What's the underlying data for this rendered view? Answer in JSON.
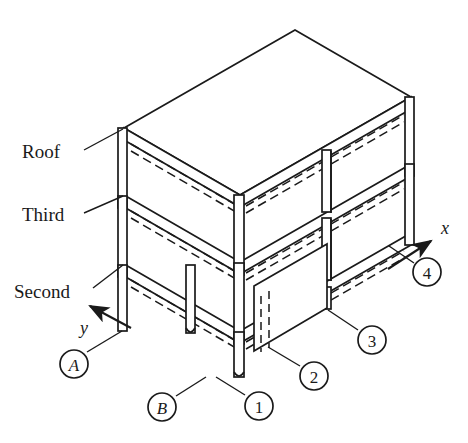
{
  "figure": {
    "kind": "isometric-structural-frame-diagram",
    "stroke_color": "#1a1a1a",
    "fill_color": "#ffffff",
    "background_color": "#ffffff"
  },
  "level_labels": [
    {
      "id": "roof",
      "text": "Roof",
      "x": 22,
      "y": 158,
      "leader_from": [
        83,
        150
      ],
      "leader_to": [
        124,
        129
      ]
    },
    {
      "id": "third",
      "text": "Third",
      "x": 22,
      "y": 221,
      "leader_from": [
        83,
        213
      ],
      "leader_to": [
        124,
        196
      ]
    },
    {
      "id": "second",
      "text": "Second",
      "x": 14,
      "y": 298,
      "leader_from": [
        92,
        290
      ],
      "leader_to": [
        124,
        265
      ]
    }
  ],
  "axes": [
    {
      "id": "x-axis",
      "label": "x",
      "label_x": 442,
      "label_y": 233,
      "tail": [
        388,
        268
      ],
      "head": [
        432,
        240
      ]
    },
    {
      "id": "y-axis",
      "label": "y",
      "label_x": 81,
      "label_y": 330,
      "tail": [
        130,
        327
      ],
      "head": [
        88,
        305
      ]
    }
  ],
  "grid_markers": [
    {
      "id": "A",
      "text": "A",
      "italic": true,
      "cx": 74,
      "cy": 364,
      "r": 14,
      "leader_from": [
        88,
        352
      ],
      "leader_to": [
        123,
        330
      ]
    },
    {
      "id": "B",
      "text": "B",
      "italic": true,
      "cx": 162,
      "cy": 407,
      "r": 14,
      "leader_from": [
        176,
        396
      ],
      "leader_to": [
        205,
        376
      ]
    },
    {
      "id": "1",
      "text": "1",
      "italic": false,
      "cx": 259,
      "cy": 406,
      "r": 14,
      "leader_from": [
        245,
        395
      ],
      "leader_to": [
        215,
        376
      ]
    },
    {
      "id": "2",
      "text": "2",
      "italic": false,
      "cx": 314,
      "cy": 376,
      "r": 14,
      "leader_from": [
        300,
        366
      ],
      "leader_to": [
        270,
        344
      ]
    },
    {
      "id": "3",
      "text": "3",
      "italic": false,
      "cx": 372,
      "cy": 340,
      "r": 14,
      "leader_from": [
        358,
        330
      ],
      "leader_to": [
        327,
        308
      ]
    },
    {
      "id": "4",
      "text": "4",
      "italic": false,
      "cx": 427,
      "cy": 272,
      "r": 14,
      "leader_from": [
        414,
        263
      ],
      "leader_to": [
        388,
        245
      ]
    }
  ],
  "geometry": {
    "note": "All coordinates are pixel positions in the 468x443 figure space",
    "roof_slab": {
      "top_face": "124,129 295,30 410,97 239,196",
      "front_edge_band": "124,129 124,140 239,207 239,196",
      "right_edge_band": "239,196 239,207 410,108 410,97"
    },
    "third_slab": {
      "front_band": "124,196 239,263 239,274 124,207",
      "right_band": "239,263 410,164 410,175 239,274"
    },
    "second_slab": {
      "front_band": "124,265 239,332 239,343 124,276",
      "right_band": "239,332 410,233 410,244 239,343"
    },
    "columns_front_left": {
      "x": 124,
      "top": 129,
      "bottom": 330,
      "width": 9
    },
    "columns_front_mid": {
      "x": 239,
      "top": 196,
      "bottom": 376,
      "width": 10
    },
    "columns_right_end": {
      "x": 410,
      "top": 97,
      "bottom": 245,
      "width": 9
    }
  }
}
